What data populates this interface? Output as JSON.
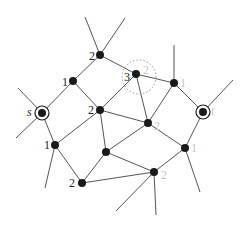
{
  "diagram": {
    "type": "graph",
    "colors": {
      "edge": "#555555",
      "node": "#1a1a1a",
      "dark_label": "#222222",
      "light_label": "#c4c4c4",
      "dotted_circle": "#999999"
    },
    "nodes": [
      {
        "id": "top",
        "x": 100,
        "y": 55,
        "labels": [
          {
            "text": "2",
            "tone": "dark",
            "dx": -11,
            "dy": -5
          }
        ]
      },
      {
        "id": "n1",
        "x": 73,
        "y": 81,
        "labels": [
          {
            "text": "1",
            "tone": "dark",
            "dx": -11,
            "dy": -5
          }
        ]
      },
      {
        "id": "s",
        "x": 42,
        "y": 113,
        "terminal": true,
        "labels": [
          {
            "text": "s",
            "tone": "dark",
            "italic": true,
            "dx": -15,
            "dy": -7
          }
        ]
      },
      {
        "id": "mid2",
        "x": 100,
        "y": 110,
        "labels": [
          {
            "text": "2",
            "tone": "dark",
            "dx": -12,
            "dy": -6
          }
        ]
      },
      {
        "id": "n3",
        "x": 136,
        "y": 74,
        "dotted": true,
        "labels": [
          {
            "text": "3",
            "tone": "dark",
            "dx": -12,
            "dy": -3
          },
          {
            "text": "2",
            "tone": "light",
            "dx": 7,
            "dy": -10
          }
        ]
      },
      {
        "id": "r1",
        "x": 174,
        "y": 83,
        "labels": [
          {
            "text": "1",
            "tone": "light",
            "dx": 6,
            "dy": -6
          }
        ]
      },
      {
        "id": "t",
        "x": 203,
        "y": 112,
        "terminal": true,
        "labels": [
          {
            "text": "t",
            "tone": "light",
            "italic": true,
            "dx": 8,
            "dy": -7
          }
        ]
      },
      {
        "id": "c2",
        "x": 148,
        "y": 123,
        "labels": [
          {
            "text": "2",
            "tone": "light",
            "dx": 6,
            "dy": -3
          }
        ]
      },
      {
        "id": "l1",
        "x": 55,
        "y": 145,
        "labels": [
          {
            "text": "1",
            "tone": "dark",
            "dx": -11,
            "dy": -6
          }
        ]
      },
      {
        "id": "r1b",
        "x": 185,
        "y": 148,
        "labels": [
          {
            "text": "1",
            "tone": "light",
            "dx": 6,
            "dy": -6
          }
        ]
      },
      {
        "id": "center",
        "x": 106,
        "y": 152,
        "labels": []
      },
      {
        "id": "bot2",
        "x": 82,
        "y": 183,
        "labels": [
          {
            "text": "2",
            "tone": "dark",
            "dx": -13,
            "dy": -6
          }
        ]
      },
      {
        "id": "bot2l",
        "x": 154,
        "y": 172,
        "labels": [
          {
            "text": "2",
            "tone": "light",
            "dx": 7,
            "dy": -3
          }
        ]
      }
    ],
    "edges": [
      [
        "top",
        "n1"
      ],
      [
        "top",
        "n3"
      ],
      [
        "n1",
        "s"
      ],
      [
        "n1",
        "mid2"
      ],
      [
        "mid2",
        "n3"
      ],
      [
        "mid2",
        "l1"
      ],
      [
        "mid2",
        "c2"
      ],
      [
        "mid2",
        "center"
      ],
      [
        "n3",
        "r1"
      ],
      [
        "n3",
        "c2"
      ],
      [
        "r1",
        "c2"
      ],
      [
        "r1",
        "t"
      ],
      [
        "s",
        "l1"
      ],
      [
        "c2",
        "center"
      ],
      [
        "c2",
        "r1b"
      ],
      [
        "t",
        "r1b"
      ],
      [
        "l1",
        "bot2"
      ],
      [
        "center",
        "bot2"
      ],
      [
        "center",
        "bot2l"
      ],
      [
        "bot2",
        "bot2l"
      ],
      [
        "r1b",
        "bot2l"
      ]
    ],
    "stubs": [
      {
        "from": "top",
        "x": 85,
        "y": 17
      },
      {
        "from": "top",
        "x": 125,
        "y": 18
      },
      {
        "from": "r1",
        "x": 174,
        "y": 45
      },
      {
        "from": "t",
        "x": 233,
        "y": 80
      },
      {
        "from": "s",
        "x": 18,
        "y": 88
      },
      {
        "from": "s",
        "x": 16,
        "y": 138
      },
      {
        "from": "l1",
        "x": 45,
        "y": 188
      },
      {
        "from": "r1b",
        "x": 200,
        "y": 192
      },
      {
        "from": "bot2l",
        "x": 116,
        "y": 211
      },
      {
        "from": "bot2l",
        "x": 156,
        "y": 215
      }
    ]
  }
}
